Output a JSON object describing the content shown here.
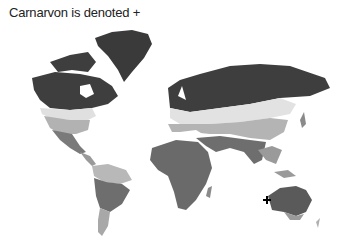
{
  "title": "Carnarvon is denoted +",
  "map": {
    "type": "world-climate-zones",
    "style": "grayscale",
    "marker": {
      "symbol": "+",
      "label": "Carnarvon",
      "location": "Western Australia coast"
    },
    "zone_shades": {
      "polar_boreal": "#3e3e3e",
      "cold_temperate": "#e2e2e2",
      "warm_temperate": "#b4b4b4",
      "arid_tropical": "#6e6e6e",
      "subtropical": "#9a9a9a"
    }
  }
}
